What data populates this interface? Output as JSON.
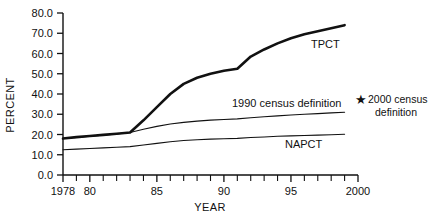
{
  "chart_data": {
    "type": "line",
    "title": "",
    "xlabel": "YEAR",
    "ylabel": "PERCENT",
    "xlim": [
      1978,
      2000
    ],
    "ylim": [
      0.0,
      80.0
    ],
    "grid": false,
    "legend_position": "inline-labels",
    "y_ticks": [
      "0.0",
      "10.0",
      "20.0",
      "30.0",
      "40.0",
      "50.0",
      "60.0",
      "70.0",
      "80.0"
    ],
    "y_tick_values": [
      0.0,
      10.0,
      20.0,
      30.0,
      40.0,
      50.0,
      60.0,
      70.0,
      80.0
    ],
    "x_ticks": [
      "1978",
      "80",
      "85",
      "90",
      "95",
      "2000"
    ],
    "x_tick_values": [
      1978,
      1980,
      1985,
      1990,
      1995,
      2000
    ],
    "x_minor_tick_values": [
      1979,
      1981,
      1982,
      1983,
      1984,
      1986,
      1987,
      1988,
      1989,
      1991,
      1992,
      1993,
      1994,
      1996,
      1997,
      1998,
      1999
    ],
    "x": [
      1978,
      1979,
      1980,
      1981,
      1982,
      1983,
      1984,
      1985,
      1986,
      1987,
      1988,
      1989,
      1990,
      1991,
      1992,
      1993,
      1994,
      1995,
      1996,
      1997,
      1998,
      1999
    ],
    "series": [
      {
        "name": "TPCT",
        "label": "TPCT",
        "style": "thick",
        "color": "#111111",
        "values": [
          18.0,
          18.7,
          19.3,
          19.8,
          20.4,
          21.0,
          27.0,
          33.5,
          40.0,
          45.0,
          48.0,
          50.0,
          51.5,
          52.5,
          58.5,
          62.0,
          65.0,
          67.5,
          69.5,
          71.0,
          72.5,
          74.0
        ]
      },
      {
        "name": "1990 census definition",
        "label": "1990 census definition",
        "style": "thin",
        "color": "#111111",
        "values": [
          18.0,
          18.6,
          19.2,
          19.7,
          20.3,
          21.0,
          22.6,
          24.0,
          25.2,
          26.0,
          26.6,
          27.1,
          27.4,
          27.7,
          28.3,
          28.8,
          29.2,
          29.6,
          30.0,
          30.3,
          30.7,
          31.0
        ]
      },
      {
        "name": "NAPCT",
        "label": "NAPCT",
        "style": "thin",
        "color": "#111111",
        "values": [
          12.5,
          12.8,
          13.1,
          13.4,
          13.7,
          14.0,
          14.8,
          15.6,
          16.4,
          17.0,
          17.4,
          17.7,
          17.9,
          18.1,
          18.5,
          18.8,
          19.1,
          19.3,
          19.5,
          19.7,
          19.9,
          20.1
        ]
      }
    ],
    "annotations": [
      {
        "name": "census-2000-note",
        "marker": "★",
        "line1": "2000 census",
        "line2": "definition"
      }
    ]
  },
  "colors": {
    "axis": "#111111",
    "text": "#111111",
    "background": "#ffffff"
  }
}
